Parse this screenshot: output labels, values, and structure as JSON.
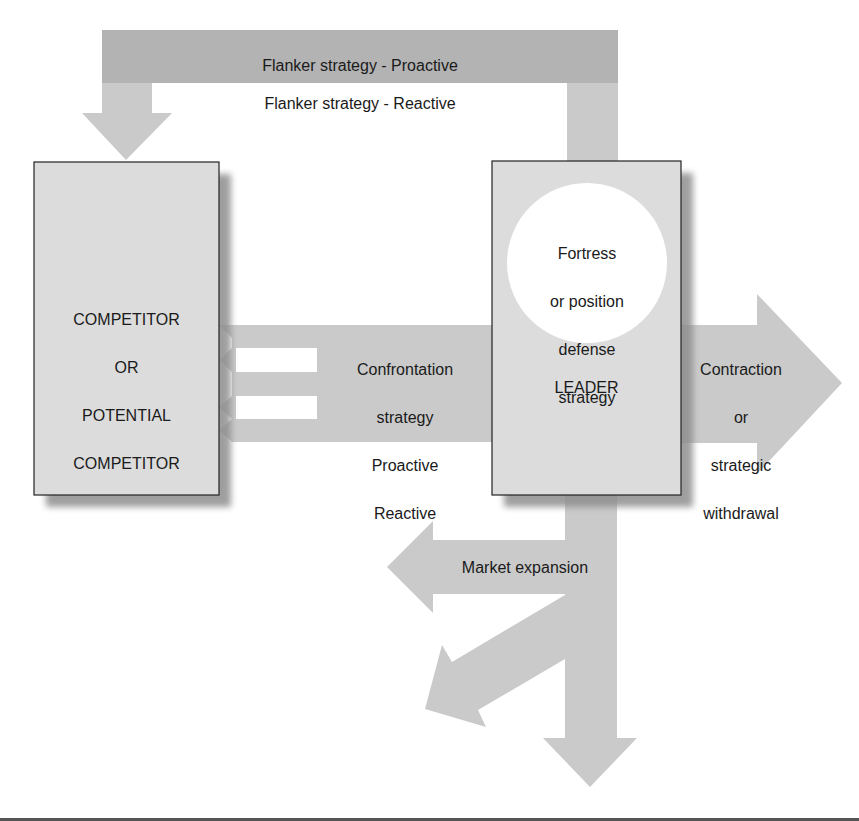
{
  "colors": {
    "band_dark": "#b3b3b3",
    "arrow": "#cacaca",
    "box_fill": "#dcdcdc",
    "box_border": "#222222",
    "shadow": "#9a9a9a",
    "circle": "#ffffff",
    "baseline": "#555555"
  },
  "flanker": {
    "line1": "Flanker strategy - Proactive",
    "line2": "Flanker strategy - Reactive"
  },
  "competitor_box": {
    "line1": "COMPETITOR",
    "line2": "OR",
    "line3": "POTENTIAL",
    "line4": "COMPETITOR"
  },
  "confrontation": {
    "line1": "Confrontation",
    "line2": "strategy",
    "line3": "Proactive",
    "line4": "Reactive"
  },
  "leader_box": {
    "label": "LEADER",
    "circle_line1": "Fortress",
    "circle_line2": "or position",
    "circle_line3": "defense",
    "circle_line4": "strategy"
  },
  "contraction": {
    "line1": "Contraction",
    "line2": "or",
    "line3": "strategic",
    "line4": "withdrawal"
  },
  "market_expansion": {
    "label": "Market expansion"
  }
}
